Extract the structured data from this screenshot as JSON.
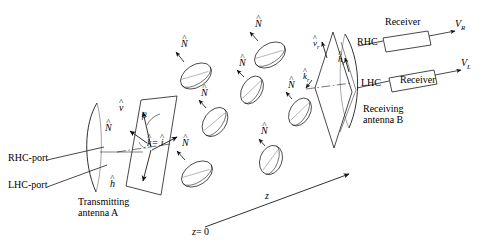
{
  "figure": {
    "type": "bistatic-polarimetric-scattering-diagram",
    "background_color": "#ffffff",
    "line_color": "#1a1a1a"
  },
  "transmitter": {
    "name_line1": "Transmitting",
    "name_line2": "antenna A",
    "ports": [
      {
        "label": "RHC-port"
      },
      {
        "label": "LHC-port"
      }
    ],
    "vectors": {
      "v": "v",
      "h": "h",
      "N": "N",
      "k_equals_i": "= "
    },
    "k_symbol": "k",
    "i_symbol": "i",
    "angle": "β"
  },
  "receiver": {
    "name_line1": "Receiving",
    "name_line2": "antenna B",
    "ports": [
      {
        "label": "RHC"
      },
      {
        "label": "LHC"
      }
    ],
    "boxes": [
      {
        "label": "Receiver",
        "output": "V",
        "output_sub": "R"
      },
      {
        "label": "Receiver",
        "output": "V",
        "output_sub": "L"
      }
    ],
    "vectors": {
      "v_r": "v",
      "v_r_sub": "r",
      "h_r": "h",
      "h_r_sub": "r",
      "k_r": "k",
      "k_r_sub": "r"
    }
  },
  "scatterers": {
    "normal_label": "N",
    "count": 7,
    "items": [
      {
        "cx": 196,
        "cy": 76,
        "rx": 17,
        "ry": 11,
        "rot": -33,
        "nx": 172,
        "ny": 46
      },
      {
        "cx": 270,
        "cy": 55,
        "rx": 17,
        "ry": 11,
        "rot": -33,
        "nx": 246,
        "ny": 26
      },
      {
        "cx": 252,
        "cy": 90,
        "rx": 15,
        "ry": 10,
        "rot": -60,
        "nx": 232,
        "ny": 65
      },
      {
        "cx": 215,
        "cy": 122,
        "rx": 16,
        "ry": 11,
        "rot": -55,
        "nx": 194,
        "ny": 96
      },
      {
        "cx": 197,
        "cy": 174,
        "rx": 17,
        "ry": 11,
        "rot": -33,
        "nx": 173,
        "ny": 145
      },
      {
        "cx": 271,
        "cy": 160,
        "rx": 15,
        "ry": 11,
        "rot": -70,
        "nx": 253,
        "ny": 133
      },
      {
        "cx": 300,
        "cy": 112,
        "rx": 15,
        "ry": 10,
        "rot": -60,
        "nx": 281,
        "ny": 88
      }
    ]
  },
  "axis": {
    "label_z": "z",
    "label_origin": "= 0",
    "origin_symbol": "z"
  }
}
